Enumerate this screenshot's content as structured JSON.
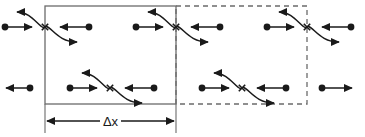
{
  "figure": {
    "kind": "physics-diagram",
    "background_color": "#ffffff",
    "stroke_color": "#1a1a1a",
    "box_stroke_color": "#6b6b6b",
    "dim_label": "Δx",
    "boxes": [
      {
        "name": "solid-control-volume",
        "style": "solid",
        "x": 45,
        "y": 6,
        "width": 131,
        "height": 98
      },
      {
        "name": "dashed-control-volume",
        "style": "dashed",
        "x": 176,
        "y": 6,
        "width": 131,
        "height": 98
      }
    ],
    "dimension": {
      "name": "delta-x-dimension",
      "label": "Δx",
      "y": 121,
      "x_start": 45,
      "x_end": 176,
      "tick_top": 104,
      "tick_bottom": 133
    },
    "collisions": [
      {
        "name": "collision-top-left",
        "x": 45,
        "y": 27
      },
      {
        "name": "collision-top-middle",
        "x": 176,
        "y": 27
      },
      {
        "name": "collision-top-right",
        "x": 307,
        "y": 27
      },
      {
        "name": "collision-mid-left",
        "x": 110,
        "y": 88
      },
      {
        "name": "collision-mid-right",
        "x": 242,
        "y": 88
      }
    ],
    "free_particles": [
      {
        "name": "free-particle-left",
        "x_dot": 30,
        "x_tip": 6,
        "y": 88,
        "direction": "left"
      },
      {
        "name": "free-particle-right",
        "x_dot": 322,
        "x_tip": 352,
        "y": 88,
        "direction": "right"
      }
    ],
    "collision_geometry": {
      "incoming_left_dot_offset": -40,
      "incoming_left_tip_offset": -13,
      "incoming_right_dot_offset": 44,
      "incoming_right_tip_offset": 15,
      "outgoing_up_tip_offset_x": -28,
      "outgoing_up_tip_offset_y": -15,
      "outgoing_down_tip_offset_x": 32,
      "outgoing_down_tip_offset_y": 15,
      "dot_radius": 3.4
    }
  }
}
